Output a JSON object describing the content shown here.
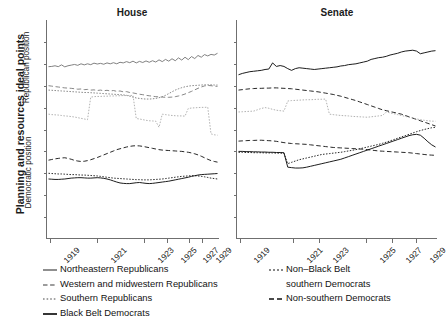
{
  "figure": {
    "ylabel_main": "Planning and resources ideal points",
    "ysub_top": "Republican position",
    "ysub_bottom": "Democratic position"
  },
  "panels": [
    {
      "key": "house",
      "title": "House"
    },
    {
      "key": "senate",
      "title": "Senate"
    }
  ],
  "xticks": {
    "house": [
      "1919",
      "1921",
      "1923",
      "1925",
      "1927",
      "1929"
    ],
    "senate": [
      "1919",
      "1921",
      "1923",
      "1925",
      "1927",
      "1929"
    ]
  },
  "legend": {
    "left": [
      {
        "label": "Northeastern Republicans",
        "style": "solid-gray",
        "name": "legend-northeastern-republicans"
      },
      {
        "label": "Western and midwestern Republicans",
        "style": "dashed-gray",
        "name": "legend-western-midwestern-republicans"
      },
      {
        "label": "Southern Republicans",
        "style": "dotted-gray",
        "name": "legend-southern-republicans"
      },
      {
        "label": "Black Belt Democrats",
        "style": "solid-black",
        "name": "legend-black-belt-democrats"
      }
    ],
    "right": [
      {
        "label": "Non–Black Belt",
        "label2": "southern Democrats",
        "style": "dotted-black",
        "name": "legend-non-black-belt-southern-democrats"
      },
      {
        "label": "Non-southern Democrats",
        "label2": "",
        "style": "dashed-black",
        "name": "legend-non-southern-democrats"
      }
    ]
  },
  "colors": {
    "gray_line": "#7a7a7a",
    "light_gray_line": "#a8a8a8",
    "black_line": "#111111",
    "axis": "#6f6f6f",
    "text": "#1b1b1b",
    "background": "#ffffff"
  },
  "chart_data": {
    "type": "line",
    "title": "Planning and resources ideal points",
    "xlabel": "",
    "ylabel": "Planning and resources ideal points",
    "grid": false,
    "legend_position": "bottom",
    "axis_notes": "x axis is by Congress session, labeled 1919-1929; y axis unlabeled, upper region = Republican position, lower region = Democratic position",
    "xlim": [
      1919,
      1930
    ],
    "ylim": [
      0,
      1
    ],
    "panels": [
      {
        "name": "House",
        "x_tick_labels": [
          "1919",
          "1921",
          "1923",
          "1925",
          "1927",
          "1929"
        ],
        "x_tick_frac": [
          0.015,
          0.29,
          0.565,
          0.7,
          0.825,
          0.9
        ],
        "series": [
          {
            "name": "Northeastern Republicans",
            "style": "solid",
            "color": "#7a7a7a",
            "y_frac": [
              0.213,
              0.212,
              0.209,
              0.213,
              0.205,
              0.214,
              0.209,
              0.206,
              0.203,
              0.207,
              0.2,
              0.205,
              0.2,
              0.204,
              0.197,
              0.201,
              0.198,
              0.202,
              0.196,
              0.2,
              0.195,
              0.2,
              0.193,
              0.196,
              0.19,
              0.195,
              0.188,
              0.196,
              0.189,
              0.194,
              0.187,
              0.193,
              0.186,
              0.192,
              0.182,
              0.19,
              0.18,
              0.188,
              0.177,
              0.186,
              0.173,
              0.183,
              0.17,
              0.181,
              0.167,
              0.176,
              0.162,
              0.17,
              0.158,
              0.164,
              0.157,
              0.16,
              0.152
            ]
          },
          {
            "name": "Western and midwestern Republicans",
            "style": "dashed",
            "color": "#7a7a7a",
            "y_frac": [
              0.3,
              0.302,
              0.304,
              0.306,
              0.308,
              0.31,
              0.311,
              0.312,
              0.314,
              0.316,
              0.315,
              0.318,
              0.317,
              0.32,
              0.319,
              0.322,
              0.32,
              0.323,
              0.321,
              0.324,
              0.322,
              0.326,
              0.324,
              0.328,
              0.327,
              0.331,
              0.333,
              0.336,
              0.339,
              0.341,
              0.344,
              0.346,
              0.348,
              0.35,
              0.351,
              0.352,
              0.353,
              0.353,
              0.352,
              0.35,
              0.347,
              0.343,
              0.338,
              0.332,
              0.326,
              0.319,
              0.312,
              0.306,
              0.301,
              0.299,
              0.3,
              0.302,
              0.303
            ]
          },
          {
            "name": "Southern Republicans",
            "style": "dotted",
            "color": "#7a7a7a",
            "y_frac": [
              0.32,
              0.321,
              0.322,
              0.323,
              0.324,
              0.325,
              0.326,
              0.327,
              0.328,
              0.329,
              0.33,
              0.331,
              0.331,
              0.332,
              0.333,
              0.334,
              0.335,
              0.336,
              0.337,
              0.338,
              0.339,
              0.34,
              0.341,
              0.342,
              0.344,
              0.348,
              0.352,
              0.356,
              0.358,
              0.36,
              0.361,
              0.361,
              0.36,
              0.358,
              0.355,
              0.35,
              0.344,
              0.336,
              0.328,
              0.32,
              0.314,
              0.309,
              0.305,
              0.302,
              0.3,
              0.299,
              0.298,
              0.297,
              0.296,
              0.296,
              0.296,
              0.297,
              0.297
            ]
          },
          {
            "name": "Southern Republicans (step segment)",
            "style": "dotted",
            "color": "#a8a8a8",
            "y_frac": [
              0.43,
              0.432,
              0.433,
              0.434,
              0.436,
              0.438,
              0.439,
              0.441,
              0.443,
              0.446,
              0.449,
              0.452,
              0.455,
              0.352,
              0.35,
              0.349,
              0.349,
              0.348,
              0.348,
              0.347,
              0.347,
              0.346,
              0.346,
              0.345,
              0.345,
              0.345,
              0.344,
              0.45,
              0.452,
              0.455,
              0.458,
              0.46,
              0.461,
              0.462,
              0.49,
              0.43,
              0.432,
              0.434,
              0.436,
              0.437,
              0.438,
              0.438,
              0.439,
              0.404,
              0.402,
              0.401,
              0.4,
              0.399,
              0.399,
              0.398,
              0.52,
              0.524,
              0.526
            ]
          },
          {
            "name": "Non-southern Democrats",
            "style": "dashed",
            "color": "#111111",
            "y_frac": [
              0.64,
              0.637,
              0.634,
              0.632,
              0.63,
              0.629,
              0.632,
              0.636,
              0.641,
              0.644,
              0.646,
              0.645,
              0.642,
              0.638,
              0.633,
              0.628,
              0.622,
              0.616,
              0.61,
              0.604,
              0.598,
              0.592,
              0.588,
              0.584,
              0.58,
              0.577,
              0.575,
              0.574,
              0.575,
              0.577,
              0.58,
              0.583,
              0.586,
              0.589,
              0.592,
              0.594,
              0.595,
              0.596,
              0.597,
              0.598,
              0.599,
              0.6,
              0.602,
              0.604,
              0.607,
              0.611,
              0.616,
              0.622,
              0.629,
              0.636,
              0.642,
              0.646,
              0.649
            ]
          },
          {
            "name": "Non-Black Belt southern Democrats",
            "style": "dotted",
            "color": "#111111",
            "y_frac": [
              0.7,
              0.701,
              0.702,
              0.703,
              0.703,
              0.704,
              0.705,
              0.706,
              0.706,
              0.707,
              0.708,
              0.708,
              0.709,
              0.71,
              0.711,
              0.712,
              0.714,
              0.716,
              0.718,
              0.72,
              0.722,
              0.723,
              0.724,
              0.725,
              0.726,
              0.727,
              0.728,
              0.729,
              0.729,
              0.73,
              0.73,
              0.73,
              0.729,
              0.728,
              0.727,
              0.726,
              0.724,
              0.722,
              0.72,
              0.718,
              0.716,
              0.714,
              0.713,
              0.712,
              0.711,
              0.711,
              0.712,
              0.714,
              0.716,
              0.719,
              0.722,
              0.724,
              0.726
            ]
          },
          {
            "name": "Black Belt Democrats",
            "style": "solid",
            "color": "#111111",
            "y_frac": [
              0.726,
              0.727,
              0.728,
              0.728,
              0.727,
              0.726,
              0.724,
              0.722,
              0.721,
              0.72,
              0.72,
              0.721,
              0.722,
              0.722,
              0.721,
              0.72,
              0.721,
              0.723,
              0.726,
              0.73,
              0.735,
              0.74,
              0.744,
              0.746,
              0.747,
              0.747,
              0.745,
              0.743,
              0.742,
              0.744,
              0.746,
              0.747,
              0.746,
              0.744,
              0.742,
              0.74,
              0.738,
              0.736,
              0.733,
              0.73,
              0.727,
              0.724,
              0.721,
              0.718,
              0.714,
              0.711,
              0.708,
              0.706,
              0.705,
              0.704,
              0.703,
              0.702,
              0.701
            ]
          }
        ]
      },
      {
        "name": "Senate",
        "x_tick_labels": [
          "1919",
          "1921",
          "1923",
          "1925",
          "1927",
          "1929"
        ],
        "x_tick_frac": [
          0.015,
          0.28,
          0.41,
          0.645,
          0.775,
          0.895
        ],
        "series": [
          {
            "name": "Northeastern Republicans",
            "style": "solid",
            "color": "#111111",
            "y_frac": [
              0.25,
              0.244,
              0.24,
              0.236,
              0.234,
              0.232,
              0.23,
              0.226,
              0.224,
              0.196,
              0.212,
              0.208,
              0.212,
              0.222,
              0.23,
              0.222,
              0.218,
              0.22,
              0.222,
              0.224,
              0.226,
              0.224,
              0.222,
              0.22,
              0.218,
              0.216,
              0.214,
              0.21,
              0.208,
              0.204,
              0.202,
              0.2,
              0.196,
              0.192,
              0.188,
              0.18,
              0.176,
              0.172,
              0.17,
              0.166,
              0.16,
              0.156,
              0.152,
              0.146,
              0.142,
              0.14,
              0.138,
              0.142,
              0.154,
              0.15,
              0.146,
              0.142,
              0.14
            ]
          },
          {
            "name": "Western and midwestern Republicans",
            "style": "dashed",
            "color": "#111111",
            "y_frac": [
              0.32,
              0.318,
              0.316,
              0.314,
              0.313,
              0.312,
              0.312,
              0.311,
              0.311,
              0.31,
              0.31,
              0.311,
              0.312,
              0.313,
              0.314,
              0.316,
              0.318,
              0.32,
              0.322,
              0.324,
              0.326,
              0.328,
              0.331,
              0.334,
              0.337,
              0.34,
              0.344,
              0.348,
              0.353,
              0.358,
              0.363,
              0.368,
              0.374,
              0.38,
              0.386,
              0.392,
              0.398,
              0.404,
              0.41,
              0.414,
              0.418,
              0.422,
              0.426,
              0.43,
              0.436,
              0.442,
              0.448,
              0.454,
              0.46,
              0.466,
              0.472,
              0.478,
              0.484
            ]
          },
          {
            "name": "Southern Republicans",
            "style": "dotted",
            "color": "#a8a8a8",
            "y_frac": [
              0.42,
              0.419,
              0.418,
              0.417,
              0.416,
              0.41,
              0.404,
              0.4,
              0.403,
              0.408,
              0.412,
              0.414,
              0.416,
              0.37,
              0.368,
              0.367,
              0.366,
              0.365,
              0.364,
              0.364,
              0.363,
              0.362,
              0.362,
              0.361,
              0.43,
              0.432,
              0.434,
              0.436,
              0.437,
              0.438,
              0.44,
              0.441,
              0.442,
              0.443,
              0.444,
              0.442,
              0.44,
              0.438,
              0.436,
              0.42,
              0.424,
              0.428,
              0.432,
              0.436,
              0.44,
              0.444,
              0.448,
              0.452,
              0.455,
              0.458,
              0.46,
              0.462,
              0.462
            ]
          },
          {
            "name": "Non-southern Democrats",
            "style": "dashed",
            "color": "#111111",
            "y_frac": [
              0.553,
              0.552,
              0.551,
              0.55,
              0.55,
              0.549,
              0.549,
              0.55,
              0.551,
              0.552,
              0.554,
              0.557,
              0.56,
              0.562,
              0.564,
              0.565,
              0.566,
              0.567,
              0.568,
              0.57,
              0.572,
              0.574,
              0.576,
              0.578,
              0.58,
              0.582,
              0.583,
              0.584,
              0.585,
              0.586,
              0.587,
              0.588,
              0.589,
              0.59,
              0.592,
              0.594,
              0.596,
              0.598,
              0.599,
              0.6,
              0.601,
              0.602,
              0.603,
              0.604,
              0.605,
              0.606,
              0.608,
              0.61,
              0.612,
              0.614,
              0.616,
              0.617,
              0.618
            ]
          },
          {
            "name": "Non-Black Belt southern Democrats",
            "style": "dotted",
            "color": "#111111",
            "y_frac": [
              0.604,
              0.604,
              0.605,
              0.605,
              0.606,
              0.606,
              0.606,
              0.607,
              0.607,
              0.607,
              0.608,
              0.608,
              0.609,
              0.656,
              0.65,
              0.644,
              0.638,
              0.634,
              0.63,
              0.626,
              0.622,
              0.618,
              0.614,
              0.612,
              0.61,
              0.608,
              0.606,
              0.604,
              0.601,
              0.598,
              0.595,
              0.592,
              0.588,
              0.584,
              0.58,
              0.576,
              0.572,
              0.568,
              0.563,
              0.558,
              0.552,
              0.546,
              0.54,
              0.534,
              0.528,
              0.522,
              0.516,
              0.51,
              0.505,
              0.5,
              0.496,
              0.492,
              0.49
            ]
          },
          {
            "name": "Black Belt Democrats",
            "style": "solid",
            "color": "#111111",
            "y_frac": [
              0.6,
              0.6,
              0.601,
              0.601,
              0.602,
              0.602,
              0.603,
              0.603,
              0.604,
              0.604,
              0.605,
              0.605,
              0.606,
              0.672,
              0.674,
              0.676,
              0.676,
              0.675,
              0.672,
              0.668,
              0.664,
              0.66,
              0.656,
              0.652,
              0.648,
              0.644,
              0.64,
              0.636,
              0.63,
              0.624,
              0.618,
              0.612,
              0.606,
              0.6,
              0.594,
              0.588,
              0.582,
              0.576,
              0.57,
              0.564,
              0.558,
              0.552,
              0.546,
              0.54,
              0.534,
              0.528,
              0.524,
              0.522,
              0.526,
              0.54,
              0.556,
              0.57,
              0.58
            ]
          }
        ]
      }
    ]
  }
}
